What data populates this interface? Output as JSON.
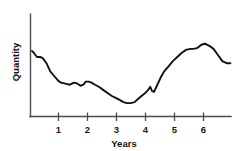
{
  "chart_data": {
    "type": "line",
    "title": "",
    "xlabel": "Years",
    "ylabel": "Quantity",
    "xlim": [
      0,
      6.9
    ],
    "ylim": [
      0,
      100
    ],
    "grid": false,
    "legend": null,
    "xticks": [
      "1",
      "2",
      "3",
      "4",
      "5",
      "6"
    ],
    "xtick_values": [
      1,
      2,
      3,
      4,
      5,
      6
    ],
    "yticks": [],
    "series": [
      {
        "name": "Quantity",
        "color": "#111111",
        "x": [
          0.05,
          0.12,
          0.22,
          0.35,
          0.42,
          0.55,
          0.68,
          0.8,
          0.95,
          1.05,
          1.2,
          1.35,
          1.5,
          1.62,
          1.72,
          1.82,
          1.9,
          2.0,
          2.1,
          2.22,
          2.35,
          2.5,
          2.65,
          2.8,
          2.95,
          3.08,
          3.2,
          3.32,
          3.45,
          3.58,
          3.7,
          3.82,
          3.95,
          4.05,
          4.12,
          4.18,
          4.25,
          4.35,
          4.48,
          4.6,
          4.75,
          4.9,
          5.05,
          5.2,
          5.35,
          5.5,
          5.62,
          5.75,
          5.88,
          6.0,
          6.15,
          6.3,
          6.45,
          6.6,
          6.75,
          6.88
        ],
        "y": [
          64,
          62,
          58,
          58,
          57,
          52,
          44,
          40,
          35,
          33,
          32,
          31,
          33,
          32,
          30,
          31,
          34,
          34,
          33,
          31,
          29,
          26,
          23,
          20,
          18,
          16,
          14,
          13,
          13,
          14,
          17,
          20,
          23,
          26,
          29,
          25,
          24,
          30,
          38,
          44,
          49,
          54,
          58,
          62,
          65,
          66,
          66,
          67,
          70,
          71,
          69,
          66,
          60,
          54,
          52,
          52
        ]
      }
    ]
  },
  "axis": {
    "x_axis_label": "Years",
    "y_axis_label": "Quantity"
  }
}
